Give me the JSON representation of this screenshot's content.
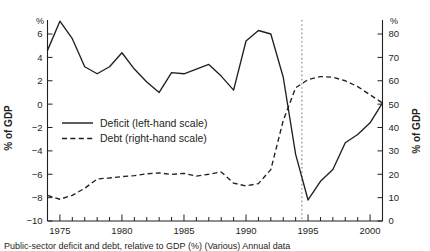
{
  "chart_data": {
    "type": "line",
    "title": "",
    "subtitle": "",
    "xlabel": "",
    "ylabel": "% of GDP",
    "ylabel_right": "% of GDP",
    "unit_label_left": "%",
    "unit_label_right": "%",
    "grid": false,
    "legend_position": "center-left",
    "xlim": [
      1974,
      2001
    ],
    "xticks_major": [
      1975,
      1980,
      1985,
      1990,
      1995,
      2000
    ],
    "xticks_minor_step": 1,
    "ylim_left": [
      -10,
      7.2
    ],
    "yticks_left": [
      6,
      4,
      2,
      0,
      -2,
      -4,
      -6,
      -8,
      -10
    ],
    "ytick_labels_left": [
      "6",
      "4",
      "2",
      "0",
      "−2",
      "−4",
      "−6",
      "−8",
      "−10"
    ],
    "ylim_right": [
      0,
      86
    ],
    "yticks_right": [
      80,
      70,
      60,
      50,
      40,
      30,
      20,
      10,
      0
    ],
    "ytick_labels_right": [
      "80",
      "70",
      "60",
      "50",
      "40",
      "30",
      "20",
      "10",
      "0"
    ],
    "annotations": [
      {
        "name": "vertical-reference-line",
        "type": "vline",
        "x": 1994.5,
        "style": "dotted",
        "color": "#9a9a9a"
      }
    ],
    "x": [
      1974,
      1975,
      1976,
      1977,
      1978,
      1979,
      1980,
      1981,
      1982,
      1983,
      1984,
      1985,
      1986,
      1987,
      1988,
      1989,
      1990,
      1991,
      1992,
      1993,
      1994,
      1995,
      1996,
      1997,
      1998,
      1999,
      2000,
      2001
    ],
    "series": [
      {
        "name": "Deficit (left-hand scale)",
        "axis": "left",
        "style": "solid",
        "color": "#231f20",
        "values": [
          4.6,
          7.1,
          5.6,
          3.2,
          2.6,
          3.2,
          4.4,
          3.0,
          1.9,
          1.0,
          2.7,
          2.6,
          3.0,
          3.4,
          2.4,
          1.2,
          5.4,
          6.3,
          6.0,
          2.3,
          -4.3,
          -8.2,
          -6.6,
          -5.6,
          -3.3,
          -2.6,
          -1.6,
          0.1
        ]
      },
      {
        "name": "Debt (right-hand scale)",
        "axis": "right",
        "style": "dashed",
        "color": "#231f20",
        "values": [
          11.0,
          9.3,
          11.0,
          14.0,
          18.0,
          18.4,
          19.0,
          19.4,
          20.2,
          20.6,
          19.9,
          20.4,
          19.2,
          20.0,
          21.0,
          16.2,
          15.0,
          16.0,
          22.0,
          43.0,
          57.0,
          60.5,
          61.8,
          61.5,
          60.0,
          57.5,
          54.0,
          50.5
        ]
      }
    ]
  },
  "legend": {
    "items": [
      {
        "label": "Deficit (left-hand scale)",
        "style": "solid"
      },
      {
        "label": "Debt (right-hand scale)",
        "style": "dashed"
      }
    ]
  },
  "caption": {
    "text": "Public-sector deficit and debt, relative to GDP (%) (Various) Annual data"
  }
}
